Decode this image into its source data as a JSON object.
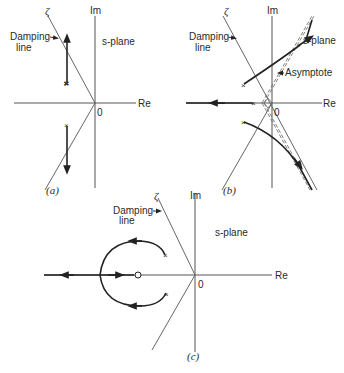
{
  "figure": {
    "panels": [
      {
        "id": "a",
        "caption": "(a)",
        "axis_labels": {
          "imag": "Im",
          "real": "Re",
          "origin": "0"
        },
        "plane_label": "s-plane",
        "damping_symbol": "ζ",
        "damping_label_line1": "Damping",
        "damping_label_line2": "line",
        "description": "Two complex poles with vertical root-locus branches moving away from real axis"
      },
      {
        "id": "b",
        "caption": "(b)",
        "axis_labels": {
          "imag": "Im",
          "real": "Re",
          "origin": "0"
        },
        "plane_label": "s-plane",
        "damping_symbol": "ζ",
        "damping_label_line1": "Damping",
        "damping_label_line2": "line",
        "asymptote_label": "Asymptote",
        "description": "Three poles; complex branches curve toward dashed asymptotes, real branch moves left"
      },
      {
        "id": "c",
        "caption": "(c)",
        "axis_labels": {
          "imag": "Im",
          "real": "Re",
          "origin": "0"
        },
        "plane_label": "s-plane",
        "damping_symbol": "ζ",
        "damping_label_line1": "Damping",
        "damping_label_line2": "line",
        "description": "Complex poles with circular locus around a zero, breaking into real axis"
      }
    ]
  }
}
